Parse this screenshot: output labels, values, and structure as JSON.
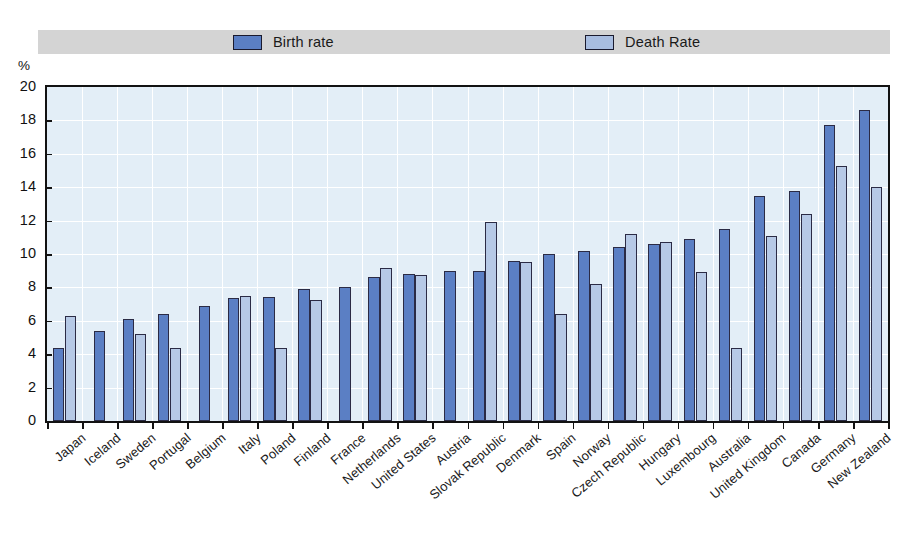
{
  "axis_unit": "%",
  "legend": {
    "entries": [
      {
        "label": "Birth rate",
        "color": "#5b7fc4",
        "icon": "legend-swatch-icon"
      },
      {
        "label": "Death Rate",
        "color": "#a8bde0",
        "icon": "legend-swatch-icon"
      }
    ]
  },
  "colors": {
    "birth": "#5b7fc4",
    "death": "#b6c9e6",
    "plot_background": "#e3eef7",
    "legend_band": "#d4d4d4",
    "axis": "#121212"
  },
  "chart_data": {
    "type": "bar",
    "title": "",
    "xlabel": "",
    "ylabel": "%",
    "ylim": [
      0,
      20
    ],
    "yticks": [
      0,
      2,
      4,
      6,
      8,
      10,
      12,
      14,
      16,
      18,
      20
    ],
    "grid": true,
    "legend_position": "top",
    "categories": [
      "Japan",
      "Iceland",
      "Sweden",
      "Portugal",
      "Belgium",
      "Italy",
      "Poland",
      "Finland",
      "France",
      "Netherlands",
      "United States",
      "Austria",
      "Slovak Republic",
      "Denmark",
      "Spain",
      "Norway",
      "Czech Republic",
      "Hungary",
      "Luxembourg",
      "Australia",
      "United Kingdom",
      "Canada",
      "Germany",
      "New Zealand"
    ],
    "series": [
      {
        "name": "Birth rate",
        "color": "#5b7fc4",
        "values": [
          4.4,
          5.4,
          6.1,
          6.4,
          6.9,
          7.35,
          7.45,
          7.9,
          8.05,
          8.6,
          8.8,
          9.0,
          9.0,
          9.6,
          10.0,
          10.2,
          10.4,
          10.6,
          10.9,
          11.5,
          13.5,
          13.8,
          17.7,
          18.6
        ]
      },
      {
        "name": "Death Rate",
        "color": "#b6c9e6",
        "values": [
          6.3,
          null,
          5.2,
          4.4,
          null,
          7.5,
          4.4,
          7.25,
          null,
          9.15,
          8.75,
          null,
          11.9,
          9.5,
          6.4,
          8.2,
          11.2,
          10.7,
          8.9,
          4.4,
          11.1,
          12.4,
          15.3,
          14.0
        ]
      }
    ]
  }
}
